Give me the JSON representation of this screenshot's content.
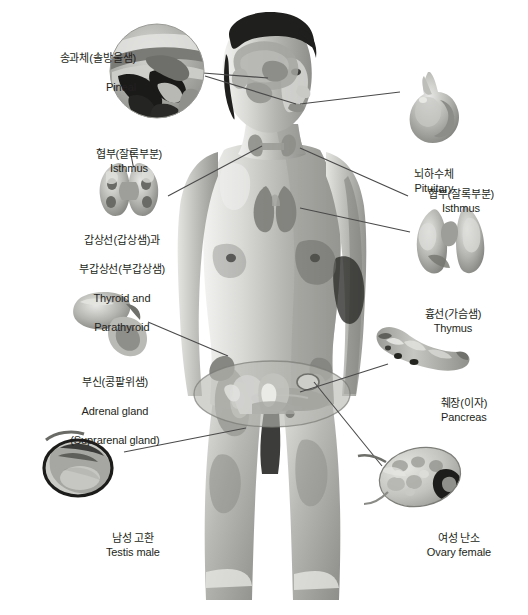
{
  "figure": {
    "background_color": "#ffffff",
    "text_color": "#231f20",
    "leader_line_color": "#4a4a4a"
  },
  "labels": [
    {
      "id": "pineal",
      "korean": "송과체(솔방울샘)",
      "english": "Pineal",
      "x": 26,
      "y": 36,
      "width": 110,
      "align": "right-align",
      "inset": "circular brain sagittal cutaway"
    },
    {
      "id": "isthmus-left",
      "korean": "협부(잘록부분)",
      "english": "Isthmus",
      "x": 58,
      "y": 132,
      "width": 130,
      "align": "center-align",
      "inset": "thyroid isthmus pointer"
    },
    {
      "id": "thyroid-parathyroid",
      "korean_line1": "갑상선(갑상샘)과",
      "korean_line2": "부갑상선(부갑상샘)",
      "english_line1": "Thyroid and",
      "english_line2": "Parathyroid",
      "x": 56,
      "y": 218,
      "width": 120,
      "align": "center-align",
      "inset": "butterfly-shaped thyroid gland with parathyroid nodules"
    },
    {
      "id": "adrenal",
      "korean": "부신(콩팥위샘)",
      "english_line1": "Adrenal gland",
      "english_line2": "(Suprarenal gland)",
      "x": 44,
      "y": 360,
      "width": 130,
      "align": "center-align",
      "inset": "adrenal gland cap on kidney"
    },
    {
      "id": "testis",
      "korean": "남성 고환",
      "english": "Testis male",
      "x": 62,
      "y": 516,
      "width": 130,
      "align": "center-align",
      "inset": "testis with epididymis"
    },
    {
      "id": "pituitary",
      "korean": "뇌하수체",
      "english": "Pituitary",
      "x": 368,
      "y": 152,
      "width": 120,
      "align": "center-align",
      "inset": "pituitary gland bulb with stalk"
    },
    {
      "id": "isthmus-right",
      "korean": "협부(잘록부분)",
      "english": "Isthmus",
      "x": 390,
      "y": 172,
      "width": 130,
      "align": "center-align",
      "inset": "thyroid isthmus pointer"
    },
    {
      "id": "thymus",
      "korean": "흉선(가슴샘)",
      "english": "Thymus",
      "x": 382,
      "y": 292,
      "width": 130,
      "align": "center-align",
      "inset": "bilobed thymus gland"
    },
    {
      "id": "pancreas",
      "korean": "췌장(이자)",
      "english": "Pancreas",
      "x": 398,
      "y": 381,
      "width": 120,
      "align": "center-align",
      "inset": "elongated pancreas with head and tail"
    },
    {
      "id": "ovary",
      "korean": "여성 난소",
      "english": "Ovary female",
      "x": 386,
      "y": 516,
      "width": 134,
      "align": "center-align",
      "inset": "ovary with follicles and corpus luteum"
    }
  ],
  "organ_insets": [
    {
      "id": "pineal-inset",
      "shape": "circle",
      "cx": 157,
      "cy": 71,
      "r": 47
    },
    {
      "id": "thyroid-inset",
      "shape": "butterfly",
      "cx": 128,
      "cy": 188
    },
    {
      "id": "adrenal-inset",
      "shape": "kidney-cap",
      "cx": 110,
      "cy": 315
    },
    {
      "id": "testis-inset",
      "shape": "oval-ring",
      "cx": 78,
      "cy": 468
    },
    {
      "id": "pituitary-inset",
      "shape": "bulb",
      "cx": 437,
      "cy": 105
    },
    {
      "id": "thymus-inset",
      "shape": "bilobed",
      "cx": 453,
      "cy": 240
    },
    {
      "id": "pancreas-inset",
      "shape": "elongated",
      "cx": 423,
      "cy": 358
    },
    {
      "id": "ovary-inset",
      "shape": "follicular-oval",
      "cx": 420,
      "cy": 477
    }
  ],
  "body_overlays": [
    {
      "id": "brain-overlay",
      "region": "head"
    },
    {
      "id": "thyroid-overlay",
      "region": "neck"
    },
    {
      "id": "thymus-overlay",
      "region": "upper-chest"
    },
    {
      "id": "adrenal-kidney-overlay",
      "region": "abdomen"
    },
    {
      "id": "pancreas-overlay",
      "region": "abdomen"
    },
    {
      "id": "pelvis-oval-overlay",
      "region": "pelvis"
    }
  ]
}
